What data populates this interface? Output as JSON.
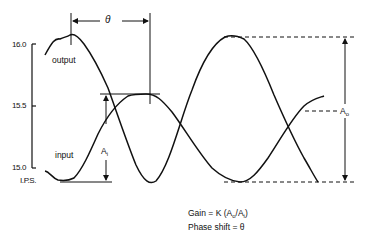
{
  "diagram": {
    "title": "",
    "y_axis": {
      "unit": "I.P.S.",
      "ticks": [
        "16.0",
        "15.5",
        "15.0"
      ]
    },
    "curves": {
      "output": "output",
      "input": "input"
    },
    "annotations": {
      "phase": "θ",
      "input_amplitude": "A",
      "input_amplitude_sub": "i",
      "output_amplitude": "A",
      "output_amplitude_sub": "o"
    },
    "formula": {
      "gain_prefix": "Gain = K (A",
      "gain_sub_o": "o",
      "gain_mid": "/A",
      "gain_sub_i": "i",
      "gain_suffix": ")",
      "phase_shift": "Phase shift = θ"
    }
  }
}
